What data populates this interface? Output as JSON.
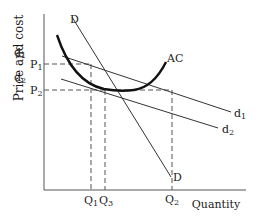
{
  "diagram": {
    "type": "economics-cost-demand",
    "y_axis_label": "Price and cost",
    "x_axis_label": "Quantity",
    "price_labels": [
      {
        "id": "P1",
        "text": "P",
        "sub": "1",
        "y": 64
      },
      {
        "id": "P2",
        "text": "P",
        "sub": "2",
        "y": 90
      }
    ],
    "quantity_labels": [
      {
        "id": "Q1",
        "text": "Q",
        "sub": "1",
        "x": 91
      },
      {
        "id": "Q3",
        "text": "Q",
        "sub": "3",
        "x": 105
      },
      {
        "id": "Q2",
        "text": "Q",
        "sub": "2",
        "x": 172
      }
    ],
    "curves": {
      "D": {
        "label": "D",
        "label_bottom": "D"
      },
      "AC": {
        "label": "AC"
      },
      "d1": {
        "label": "d",
        "sub": "1"
      },
      "d2": {
        "label": "d",
        "sub": "2"
      }
    },
    "colors": {
      "ink": "#1a1a1a",
      "background": "#ffffff"
    }
  }
}
